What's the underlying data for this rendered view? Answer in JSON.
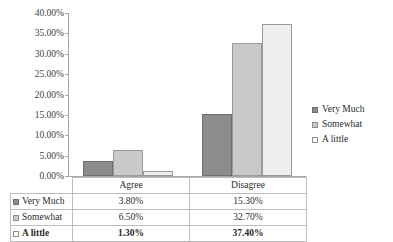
{
  "chart_data": {
    "type": "bar",
    "title": "",
    "xlabel": "",
    "ylabel": "",
    "categories": [
      "Agree",
      "Disagree"
    ],
    "series": [
      {
        "name": "Very Much",
        "values": [
          3.8,
          15.3
        ],
        "labels": [
          "3.80%",
          "15.30%"
        ],
        "color": "#8c8c8c"
      },
      {
        "name": "Somewhat",
        "values": [
          6.5,
          32.7
        ],
        "labels": [
          "6.50%",
          "32.70%"
        ],
        "color": "#c9c9c9"
      },
      {
        "name": "A little",
        "values": [
          1.3,
          37.4
        ],
        "labels": [
          "1.30%",
          "37.40%"
        ],
        "color": "#efefef"
      }
    ],
    "ylim": [
      0,
      40
    ],
    "ytick_step": 5,
    "ytick_labels": [
      "40.00%",
      "35.00%",
      "30.00%",
      "25.00%",
      "20.00%",
      "15.00%",
      "10.00%",
      "5.00%",
      "0.00%"
    ],
    "grid": false,
    "legend_position": "right",
    "has_data_table": true
  },
  "title_strip": {
    "text": ""
  },
  "legend": {
    "items": [
      {
        "label": "Very Much"
      },
      {
        "label": "Somewhat"
      },
      {
        "label": "A little"
      }
    ]
  },
  "table": {
    "corner": "",
    "column_headers": [
      "Agree",
      "Disagree"
    ],
    "rows": [
      {
        "label": "Very Much",
        "cells": [
          "3.80%",
          "15.30%"
        ],
        "bold": false
      },
      {
        "label": "Somewhat",
        "cells": [
          "6.50%",
          "32.70%"
        ],
        "bold": false
      },
      {
        "label": "A little",
        "cells": [
          "1.30%",
          "37.40%"
        ],
        "bold": true
      }
    ]
  }
}
